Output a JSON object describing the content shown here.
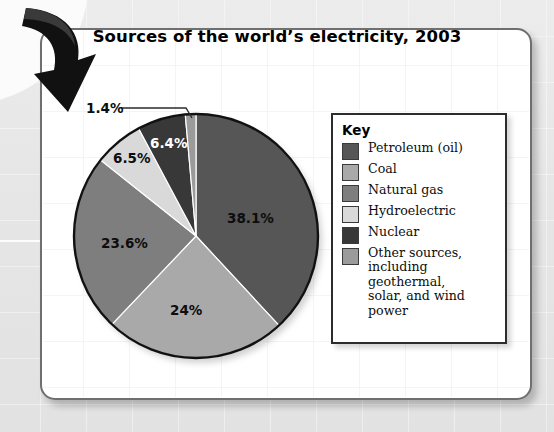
{
  "chart_data": {
    "type": "pie",
    "title": "Sources of the world’s electricity, 2003",
    "legend_title": "Key",
    "legend_position": "right",
    "categories": [
      "Petroleum (oil)",
      "Coal",
      "Natural gas",
      "Hydroelectric",
      "Nuclear",
      "Other sources, including geothermal, solar, and wind power"
    ],
    "values": [
      38.1,
      24,
      23.6,
      6.5,
      6.4,
      1.4
    ],
    "value_labels": [
      "38.1%",
      "24%",
      "23.6%",
      "6.5%",
      "6.4%",
      "1.4%"
    ],
    "colors": [
      "#565656",
      "#a9a9a9",
      "#7e7e7e",
      "#d9d9d9",
      "#383838",
      "#9b9b9b"
    ],
    "units": "percent",
    "xlabel": "",
    "ylabel": ""
  },
  "card": {
    "title": "Sources of the world’s electricity, 2003"
  },
  "legend": {
    "title": "Key",
    "items": [
      {
        "label": "Petroleum (oil)",
        "color": "#565656"
      },
      {
        "label": "Coal",
        "color": "#a9a9a9"
      },
      {
        "label": "Natural gas",
        "color": "#7e7e7e"
      },
      {
        "label": "Hydroelectric",
        "color": "#d9d9d9"
      },
      {
        "label": "Nuclear",
        "color": "#383838"
      },
      {
        "label": "Other sources, including geothermal, solar, and wind power",
        "color": "#9b9b9b",
        "line1": "Other sources,",
        "line2": "including geothermal,",
        "line3": "solar, and wind power"
      }
    ]
  },
  "pie_labels": {
    "petroleum": "38.1%",
    "coal": "24%",
    "natural_gas": "23.6%",
    "hydroelectric": "6.5%",
    "nuclear": "6.4%",
    "other": "1.4%"
  },
  "decor": {
    "arrow": "curved-down-right-arrow"
  }
}
